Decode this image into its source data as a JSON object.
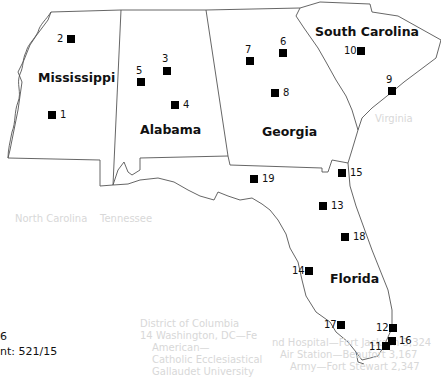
{
  "map": {
    "states": [
      {
        "name": "Mississippi",
        "x": 38,
        "y": 70
      },
      {
        "name": "Alabama",
        "x": 140,
        "y": 122
      },
      {
        "name": "Georgia",
        "x": 262,
        "y": 124
      },
      {
        "name": "South Carolina",
        "x": 315,
        "y": 24
      },
      {
        "name": "Florida",
        "x": 330,
        "y": 271
      }
    ],
    "markers": [
      {
        "id": "1",
        "mx": 48,
        "my": 111,
        "lx": 60,
        "ly": 109
      },
      {
        "id": "2",
        "mx": 67,
        "my": 35,
        "lx": 57,
        "ly": 33
      },
      {
        "id": "3",
        "mx": 163,
        "my": 67,
        "lx": 162,
        "ly": 53
      },
      {
        "id": "4",
        "mx": 171,
        "my": 101,
        "lx": 183,
        "ly": 99
      },
      {
        "id": "5",
        "mx": 137,
        "my": 78,
        "lx": 136,
        "ly": 65
      },
      {
        "id": "6",
        "mx": 279,
        "my": 49,
        "lx": 280,
        "ly": 36
      },
      {
        "id": "7",
        "mx": 246,
        "my": 57,
        "lx": 245,
        "ly": 44
      },
      {
        "id": "8",
        "mx": 271,
        "my": 89,
        "lx": 283,
        "ly": 87
      },
      {
        "id": "9",
        "mx": 388,
        "my": 87,
        "lx": 386,
        "ly": 74
      },
      {
        "id": "10",
        "mx": 357,
        "my": 47,
        "lx": 344,
        "ly": 45
      },
      {
        "id": "11",
        "mx": 382,
        "my": 342,
        "lx": 369,
        "ly": 341
      },
      {
        "id": "12",
        "mx": 389,
        "my": 324,
        "lx": 376,
        "ly": 322
      },
      {
        "id": "13",
        "mx": 319,
        "my": 202,
        "lx": 331,
        "ly": 200
      },
      {
        "id": "14",
        "mx": 305,
        "my": 267,
        "lx": 292,
        "ly": 265
      },
      {
        "id": "15",
        "mx": 338,
        "my": 169,
        "lx": 350,
        "ly": 167
      },
      {
        "id": "16",
        "mx": 388,
        "my": 337,
        "lx": 399,
        "ly": 335
      },
      {
        "id": "17",
        "mx": 337,
        "my": 321,
        "lx": 324,
        "ly": 319
      },
      {
        "id": "18",
        "mx": 341,
        "my": 233,
        "lx": 353,
        "ly": 231
      },
      {
        "id": "19",
        "mx": 250,
        "my": 175,
        "lx": 262,
        "ly": 173
      }
    ]
  },
  "caption": {
    "line1": "6",
    "line2": "nt: 521/15"
  },
  "ghost_text": [
    {
      "text": "Virginia",
      "x": 375,
      "y": 113
    },
    {
      "text": "North Carolina",
      "x": 15,
      "y": 213
    },
    {
      "text": "Tennessee",
      "x": 100,
      "y": 213
    },
    {
      "text": "District of Columbia",
      "x": 140,
      "y": 318
    },
    {
      "text": "14  Washington, DC—Fe",
      "x": 140,
      "y": 330
    },
    {
      "text": "American—",
      "x": 152,
      "y": 342
    },
    {
      "text": "Catholic Ecclesiastical",
      "x": 152,
      "y": 354
    },
    {
      "text": "Gallaudet University",
      "x": 152,
      "y": 366
    },
    {
      "text": "nd Hospital—Fort Jackson 3,324",
      "x": 272,
      "y": 337
    },
    {
      "text": "Air Station—Beaufort 3,167",
      "x": 280,
      "y": 349
    },
    {
      "text": "Army—Fort Stewart 2,347",
      "x": 290,
      "y": 361
    }
  ],
  "colors": {
    "border": "#555555",
    "marker": "#000000",
    "label": "#111111"
  }
}
